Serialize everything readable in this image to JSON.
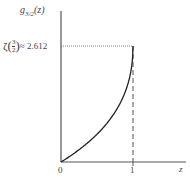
{
  "chart_data": {
    "type": "line",
    "title": "",
    "ylabel": "g3/2(z)",
    "xlabel": "z",
    "x_ticks": [
      "0",
      "1"
    ],
    "annotations": [
      {
        "text": "ζ(3/2) ≈ 2.612",
        "x": 0,
        "y": 2.612,
        "note": "dotted horizontal reference line from y-axis to z=1"
      },
      {
        "text": "dashed vertical line at z = 1"
      }
    ],
    "xlim": [
      0,
      1.6
    ],
    "ylim": [
      0,
      3.4
    ],
    "grid": false,
    "series": [
      {
        "name": "g_{3/2}(z)",
        "x": [
          0,
          0.1,
          0.2,
          0.3,
          0.4,
          0.5,
          0.6,
          0.7,
          0.8,
          0.9,
          0.95,
          1.0
        ],
        "values": [
          0,
          0.104,
          0.216,
          0.337,
          0.469,
          0.612,
          0.77,
          0.952,
          1.17,
          1.474,
          1.7,
          2.612
        ]
      }
    ]
  },
  "labels": {
    "ylabel_main": "g",
    "ylabel_sub": "3/2",
    "ylabel_arg": "(z)",
    "xlabel": "z",
    "tick_0": "0",
    "tick_1": "1",
    "zeta_prefix": "ζ",
    "zeta_num": "3",
    "zeta_den": "2",
    "zeta_value": "≈ 2.612"
  }
}
